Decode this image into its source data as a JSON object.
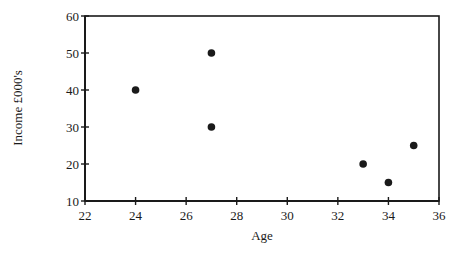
{
  "chart_data": {
    "type": "scatter",
    "title": "",
    "xlabel": "Age",
    "ylabel": "Income £000's",
    "xlim": [
      22,
      36
    ],
    "ylim": [
      10,
      60
    ],
    "x_ticks": [
      22,
      24,
      26,
      28,
      30,
      32,
      34,
      36
    ],
    "y_ticks": [
      10,
      20,
      30,
      40,
      50,
      60
    ],
    "grid": false,
    "legend": null,
    "series": [
      {
        "name": "Income vs Age",
        "points": [
          {
            "x": 24,
            "y": 40
          },
          {
            "x": 27,
            "y": 50
          },
          {
            "x": 27,
            "y": 30
          },
          {
            "x": 33,
            "y": 20
          },
          {
            "x": 34,
            "y": 15
          },
          {
            "x": 35,
            "y": 25
          }
        ],
        "color": "#1a1a1a"
      }
    ]
  }
}
